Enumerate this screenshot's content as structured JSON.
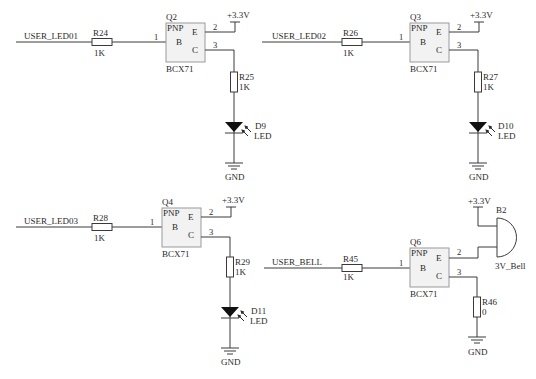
{
  "schematic": {
    "supply_label": "+3.3V",
    "ground_label": "GND",
    "colors": {
      "wire": "#3a3a3a",
      "transistor_body": "#f2f2f2",
      "transistor_border": "#9a9a9a",
      "background": "#ffffff"
    },
    "circuits": [
      {
        "net": "USER_LED01",
        "base_resistor": {
          "ref": "R24",
          "value": "1K"
        },
        "transistor": {
          "ref": "Q2",
          "type": "PNP",
          "part": "BCX71",
          "pin_b": "B",
          "pin_e": "E",
          "pin_c": "C",
          "pin1": "1",
          "pin2": "2",
          "pin3": "3"
        },
        "collector_resistor": {
          "ref": "R25",
          "value": "1K"
        },
        "load": {
          "ref": "D9",
          "value": "LED"
        }
      },
      {
        "net": "USER_LED02",
        "base_resistor": {
          "ref": "R26",
          "value": "1K"
        },
        "transistor": {
          "ref": "Q3",
          "type": "PNP",
          "part": "BCX71",
          "pin_b": "B",
          "pin_e": "E",
          "pin_c": "C",
          "pin1": "1",
          "pin2": "2",
          "pin3": "3"
        },
        "collector_resistor": {
          "ref": "R27",
          "value": "1K"
        },
        "load": {
          "ref": "D10",
          "value": "LED"
        }
      },
      {
        "net": "USER_LED03",
        "base_resistor": {
          "ref": "R28",
          "value": "1K"
        },
        "transistor": {
          "ref": "Q4",
          "type": "PNP",
          "part": "BCX71",
          "pin_b": "B",
          "pin_e": "E",
          "pin_c": "C",
          "pin1": "1",
          "pin2": "2",
          "pin3": "3"
        },
        "collector_resistor": {
          "ref": "R29",
          "value": "1K"
        },
        "load": {
          "ref": "D11",
          "value": "LED"
        }
      },
      {
        "net": "USER_BELL",
        "base_resistor": {
          "ref": "R45",
          "value": "1K"
        },
        "transistor": {
          "ref": "Q6",
          "type": "PNP",
          "part": "BCX71",
          "pin_b": "B",
          "pin_e": "E",
          "pin_c": "C",
          "pin1": "1",
          "pin2": "2",
          "pin3": "3"
        },
        "collector_resistor": {
          "ref": "R46",
          "value": "0"
        },
        "load": {
          "ref": "B2",
          "value": "3V_Bell"
        }
      }
    ]
  }
}
